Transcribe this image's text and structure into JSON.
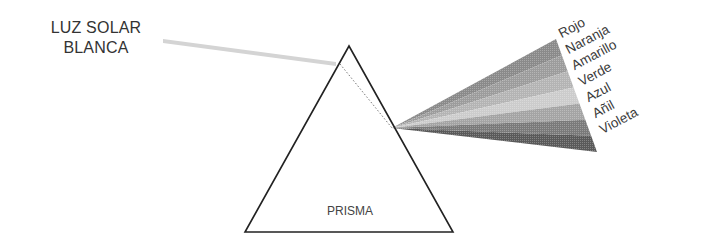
{
  "diagram": {
    "source_label_line1": "LUZ SOLAR",
    "source_label_line2": "BLANCA",
    "prism_label": "PRISMA",
    "spectrum": [
      {
        "name": "Rojo",
        "shade": "#8a8a8a"
      },
      {
        "name": "Naranja",
        "shade": "#9c9c9c"
      },
      {
        "name": "Amarillo",
        "shade": "#b4b4b4"
      },
      {
        "name": "Verde",
        "shade": "#cccccc"
      },
      {
        "name": "Azul",
        "shade": "#a4a4a4"
      },
      {
        "name": "Añil",
        "shade": "#7a7a7a"
      },
      {
        "name": "Violeta",
        "shade": "#5a5a5a"
      }
    ]
  }
}
